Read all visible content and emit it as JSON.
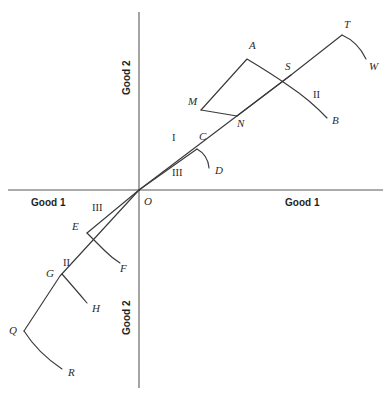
{
  "figure": {
    "background_color": "#ffffff",
    "line_color": "#3a3a3c",
    "axis_color": "#58585a"
  },
  "axes": {
    "origin_label": "O",
    "x_left_label": "Good 1",
    "x_right_label": "Good 1",
    "y_top_label": "Good 2",
    "y_bottom_label": "Good 2",
    "origin_px": {
      "x": 139,
      "y": 190
    },
    "x_axis_px": {
      "x1": 8,
      "y1": 190,
      "x2": 383,
      "y2": 190
    },
    "y_axis_px": {
      "x1": 139,
      "y1": 12,
      "x2": 139,
      "y2": 388
    }
  },
  "region_labels": [
    {
      "name": "region-I",
      "text": "I",
      "x": 172,
      "y": 141
    },
    {
      "name": "region-III-upper",
      "text": "III",
      "x": 172,
      "y": 176
    },
    {
      "name": "region-II-upper",
      "text": "II",
      "x": 313,
      "y": 98
    },
    {
      "name": "region-III-lower",
      "text": "III",
      "x": 92,
      "y": 211
    },
    {
      "name": "region-II-lower",
      "text": "II",
      "x": 63,
      "y": 266
    }
  ],
  "point_labels": [
    {
      "name": "point-A",
      "text": "A",
      "x": 249,
      "y": 49
    },
    {
      "name": "point-B",
      "text": "B",
      "x": 332,
      "y": 124
    },
    {
      "name": "point-C",
      "text": "C",
      "x": 199,
      "y": 140
    },
    {
      "name": "point-D",
      "text": "D",
      "x": 215,
      "y": 174
    },
    {
      "name": "point-E",
      "text": "E",
      "x": 79,
      "y": 230
    },
    {
      "name": "point-F",
      "text": "F",
      "x": 117,
      "y": 268
    },
    {
      "name": "point-G",
      "text": "G",
      "x": 50,
      "y": 280
    },
    {
      "name": "point-H",
      "text": "H",
      "x": 92,
      "y": 312
    },
    {
      "name": "point-M",
      "text": "M",
      "x": 193,
      "y": 103
    },
    {
      "name": "point-N",
      "text": "N",
      "x": 241,
      "y": 123
    },
    {
      "name": "point-O",
      "text": "O",
      "x": 144,
      "y": 205
    },
    {
      "name": "point-Q",
      "text": "Q",
      "x": 8,
      "y": 334
    },
    {
      "name": "point-R",
      "text": "R",
      "x": 68,
      "y": 375
    },
    {
      "name": "point-S",
      "text": "S",
      "x": 286,
      "y": 70
    },
    {
      "name": "point-T",
      "text": "T",
      "x": 345,
      "y": 27
    },
    {
      "name": "point-W",
      "text": "W",
      "x": 372,
      "y": 67
    }
  ],
  "paths": {
    "ray_O_to_T": {
      "name": "ray-O-to-T",
      "description": "Straight ray from origin O up-right through M and S to T",
      "d": "M 139 190 L 291 75 L 342 35"
    },
    "curve_T_to_W": {
      "name": "curve-T-to-W",
      "description": "Curve bending down-right from T to W",
      "d": "M 342 35 Q 358 42 366 59"
    },
    "curve_M_A_S_B": {
      "name": "curve-M-A-S-B",
      "description": "Path from M up to A then down through S curving to B",
      "d": "M 201 110 L 247 59 Q 272 74 289 86 Q 310 100 327 118"
    },
    "segment_M_to_N": {
      "name": "segment-M-to-N",
      "description": "Straight segment from M down-right to N",
      "d": "M 201 110 L 237 116"
    },
    "segment_N_to_S": {
      "name": "segment-N-to-S",
      "description": "Straight segment from N up-right to S crossing region",
      "d": "M 237 116 L 291 75"
    },
    "ray_O_to_C": {
      "name": "ray-O-to-C",
      "description": "Straight ray from origin O up-right to C",
      "d": "M 139 190 L 197 149"
    },
    "curve_C_to_D": {
      "name": "curve-C-to-D",
      "description": "Curve bending down-right from C to D",
      "d": "M 197 149 Q 208 155 209 168"
    },
    "ray_O_to_Q": {
      "name": "ray-O-to-Q",
      "description": "Long straight ray from origin O down-left through E-crossing, G to Q",
      "d": "M 139 190 L 60 276 L 24 331"
    },
    "curve_Q_to_R": {
      "name": "curve-Q-to-R",
      "description": "Curve bending down-right from Q to R",
      "d": "M 24 331 Q 38 353 62 369"
    },
    "ray_O_to_E": {
      "name": "ray-O-to-E",
      "description": "Straight ray from origin O down-left to E",
      "d": "M 139 190 L 87 233"
    },
    "curve_E_to_F": {
      "name": "curve-E-to-F",
      "description": "Curve from E bending down-right to F, crossing the O-Q ray",
      "d": "M 87 233 Q 97 243 104 250 Q 112 258 120 263"
    },
    "curve_G_to_H": {
      "name": "curve-G-to-H",
      "description": "Curve from G bending down-right to H",
      "d": "M 62 274 Q 76 290 87 303"
    }
  }
}
